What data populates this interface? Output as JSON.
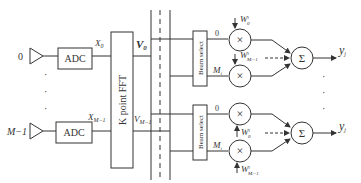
{
  "diagram": {
    "inputs": [
      {
        "index_label": "0",
        "adc_label": "ADC",
        "signal_label": "X",
        "signal_sub": "0"
      },
      {
        "index_label": "M−1",
        "adc_label": "ADC",
        "signal_label": "X",
        "signal_sub": "M−1"
      }
    ],
    "ellipsis": "·",
    "fft": {
      "label": "K point FFT"
    },
    "fft_outputs": [
      {
        "label": "V",
        "sub": "0"
      },
      {
        "label": "V",
        "sub": "M−1"
      }
    ],
    "branches": [
      {
        "beam_select_label": "Beam select",
        "port_top": "0",
        "port_bottom": "M",
        "port_bottom_sub": "i",
        "weight_top": "W",
        "weight_top_sup": "i",
        "weight_top_sub": "0",
        "weight_bottom": "W",
        "weight_bottom_sup": "i",
        "weight_bottom_sub": "Mᵢ−1",
        "multiplier_symbol": "×",
        "sum_symbol": "Σ",
        "output": "y",
        "output_sub": "j"
      },
      {
        "beam_select_label": "Beam select",
        "port_top": "0",
        "port_bottom": "M",
        "port_bottom_sub": "i",
        "weight_top": "W",
        "weight_top_sup": "i",
        "weight_top_sub": "0",
        "weight_bottom": "W",
        "weight_bottom_sup": "i",
        "weight_bottom_sub": "Mᵢ−1",
        "multiplier_symbol": "×",
        "sum_symbol": "Σ",
        "output": "y",
        "output_sub": "j"
      }
    ],
    "colors": {
      "stroke": "#333333",
      "background": "#ffffff"
    }
  }
}
